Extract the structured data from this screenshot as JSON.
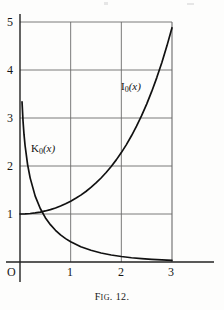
{
  "figure": {
    "caption_prefix": "F",
    "caption_smallcaps": "IG",
    "caption_suffix": ". 12.",
    "caption_full": "FIG. 12."
  },
  "chart_data": {
    "type": "line",
    "title": "",
    "xlabel": "",
    "ylabel": "",
    "xlim": [
      0,
      3
    ],
    "ylim": [
      0,
      5
    ],
    "grid": true,
    "legend_position": "inline-annotation",
    "origin_label": "O",
    "xticks": [
      0,
      1,
      2,
      3
    ],
    "xtick_labels": [
      "O",
      "1",
      "2",
      "3"
    ],
    "yticks": [
      1,
      2,
      3,
      4,
      5
    ],
    "ytick_labels": [
      "1",
      "2",
      "3",
      "4",
      "5"
    ],
    "series": [
      {
        "name": "I0(x)",
        "label_base": "I",
        "label_sub": "0",
        "label_arg": "(x)",
        "annotation_x": 2.05,
        "annotation_y": 3.55,
        "x": [
          0,
          0.1,
          0.2,
          0.3,
          0.4,
          0.5,
          0.6,
          0.7,
          0.8,
          0.9,
          1.0,
          1.1,
          1.2,
          1.3,
          1.4,
          1.5,
          1.6,
          1.7,
          1.8,
          1.9,
          2.0,
          2.1,
          2.2,
          2.3,
          2.4,
          2.5,
          2.6,
          2.7,
          2.8,
          2.9,
          3.0
        ],
        "y": [
          1.0,
          1.0025,
          1.01,
          1.0226,
          1.0404,
          1.0635,
          1.092,
          1.1263,
          1.1665,
          1.213,
          1.2661,
          1.3262,
          1.3937,
          1.4693,
          1.5534,
          1.6467,
          1.75,
          1.864,
          1.9896,
          2.1277,
          2.2796,
          2.4463,
          2.6291,
          2.8296,
          3.0493,
          3.2898,
          3.5533,
          3.8417,
          4.1573,
          4.5027,
          4.8808
        ]
      },
      {
        "name": "K0(x)",
        "label_base": "K",
        "label_sub": "0",
        "label_arg": "(x)",
        "annotation_x": 0.42,
        "annotation_y": 2.46,
        "x": [
          0.04,
          0.06,
          0.08,
          0.1,
          0.15,
          0.2,
          0.3,
          0.4,
          0.5,
          0.6,
          0.7,
          0.8,
          0.9,
          1.0,
          1.2,
          1.4,
          1.6,
          1.8,
          2.0,
          2.2,
          2.4,
          2.6,
          2.8,
          3.0
        ],
        "y": [
          3.336,
          2.933,
          2.647,
          2.427,
          2.03,
          1.753,
          1.372,
          1.115,
          0.924,
          0.778,
          0.661,
          0.565,
          0.487,
          0.421,
          0.318,
          0.244,
          0.188,
          0.146,
          0.114,
          0.089,
          0.07,
          0.055,
          0.043,
          0.035
        ]
      }
    ]
  },
  "colors": {
    "ink": "#1a1a1a",
    "grid": "#6b6b6b",
    "axis": "#222222",
    "paper": "#fdfdfc"
  }
}
